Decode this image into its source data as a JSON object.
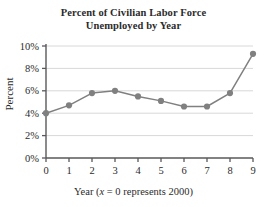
{
  "chart_data": {
    "type": "line",
    "title": "Percent of Civilian Labor Force Unemployed by Year",
    "title_lines": [
      "Percent of Civilian Labor Force",
      "Unemployed by Year"
    ],
    "xlabel": "Year (x = 0 represents 2000)",
    "xlabel_parts": {
      "before": "Year (",
      "italic": "x",
      "after": " = 0 represents 2000)"
    },
    "ylabel": "Percent",
    "x": [
      0,
      1,
      2,
      3,
      4,
      5,
      6,
      7,
      8,
      9
    ],
    "values": [
      4.0,
      4.7,
      5.8,
      6.0,
      5.5,
      5.1,
      4.6,
      4.6,
      5.8,
      9.3
    ],
    "xlim": [
      0,
      9
    ],
    "ylim": [
      0,
      10
    ],
    "xticks": [
      0,
      1,
      2,
      3,
      4,
      5,
      6,
      7,
      8,
      9
    ],
    "xtick_labels": [
      "0",
      "1",
      "2",
      "3",
      "4",
      "5",
      "6",
      "7",
      "8",
      "9"
    ],
    "yticks": [
      0,
      2,
      4,
      6,
      8,
      10
    ],
    "ytick_labels": [
      "0%",
      "2%",
      "4%",
      "6%",
      "8%",
      "10%"
    ],
    "grid": "horizontal",
    "legend": "none",
    "series_color": "#808080",
    "grid_color": "#d8d8d8",
    "axis_color": "#595959",
    "marker": "circle"
  }
}
